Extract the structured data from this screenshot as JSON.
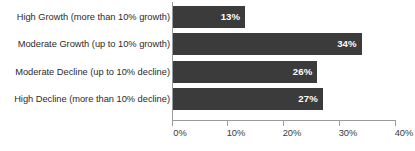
{
  "chart_data": {
    "type": "bar",
    "orientation": "horizontal",
    "title": "",
    "subtitle": "",
    "xlabel": "",
    "ylabel": "",
    "categories": [
      "High Growth (more than 10% growth)",
      "Moderate Growth (up to 10% growth)",
      "Moderate Decline (up to 10% decline)",
      "High Decline (more than 10% decline)"
    ],
    "values": [
      13,
      34,
      26,
      27
    ],
    "value_labels": [
      "13%",
      "34%",
      "26%",
      "27%"
    ],
    "xlim": [
      0,
      40
    ],
    "xticks": [
      0,
      10,
      20,
      30,
      40
    ],
    "xtick_labels": [
      "0%",
      "10%",
      "20%",
      "30%",
      "40%"
    ],
    "grid": false,
    "legend": false,
    "legend_position": "none",
    "bar_color": "#3b3b3b",
    "value_label_color": "#ffffff",
    "axis_color": "#9a9a9a",
    "category_label_color": "#2b2b2b",
    "background_color": "#ffffff"
  }
}
